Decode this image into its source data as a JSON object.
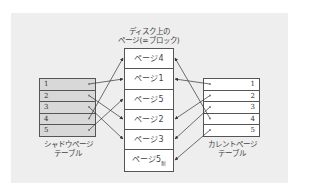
{
  "title": {
    "line1": "ディスク上の",
    "line2": "ページ(=ブロック)"
  },
  "shadow_table": {
    "label_line1": "シャドウページ",
    "label_line2": "テーブル",
    "rows": [
      "1",
      "2",
      "3",
      "4",
      "5"
    ],
    "fill_color": "#d8d8d8"
  },
  "current_table": {
    "label_line1": "カレントページ",
    "label_line2": "テーブル",
    "rows": [
      "1",
      "2",
      "3",
      "4",
      "5"
    ],
    "fill_color": "#ffffff"
  },
  "disk_pages": [
    {
      "label": "ページ4",
      "suffix": ""
    },
    {
      "label": "ページ1",
      "suffix": ""
    },
    {
      "label": "ページ5",
      "suffix": ""
    },
    {
      "label": "ページ2",
      "suffix": ""
    },
    {
      "label": "ページ3",
      "suffix": ""
    },
    {
      "label": "ページ5",
      "suffix": "新"
    }
  ],
  "mappings": {
    "shadow": [
      {
        "from": "1",
        "to": "ページ1"
      },
      {
        "from": "2",
        "to": "ページ2"
      },
      {
        "from": "3",
        "to": "ページ3"
      },
      {
        "from": "4",
        "to": "ページ4"
      },
      {
        "from": "5",
        "to": "ページ5"
      }
    ],
    "current": [
      {
        "from": "1",
        "to": "ページ1"
      },
      {
        "from": "2",
        "to": "ページ2"
      },
      {
        "from": "3",
        "to": "ページ3"
      },
      {
        "from": "4",
        "to": "ページ4"
      },
      {
        "from": "5",
        "to": "ページ5新"
      }
    ]
  }
}
